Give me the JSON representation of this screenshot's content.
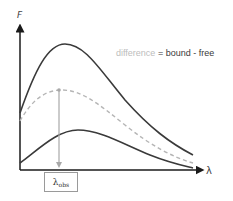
{
  "axes": {
    "y_label": "F",
    "x_label": "λ"
  },
  "legend": {
    "difference": "difference",
    "equals": " = bound - free"
  },
  "curves": [
    {
      "name": "bound",
      "style": "solid",
      "color": "#3a3a3a"
    },
    {
      "name": "difference",
      "style": "dashed",
      "color": "#b5b5b5"
    },
    {
      "name": "free",
      "style": "solid",
      "color": "#3a3a3a"
    }
  ],
  "marker": {
    "label_main": "λ",
    "label_sub": "obs",
    "color": "#a8a8a8"
  }
}
